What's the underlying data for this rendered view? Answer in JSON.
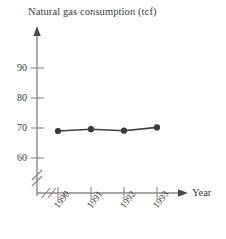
{
  "chart_data": {
    "type": "line",
    "title": "Natural gas consumption (tcf)",
    "xlabel": "Year",
    "ylabel": "",
    "categories": [
      "1990",
      "1991",
      "1992",
      "1993"
    ],
    "values": [
      69.0,
      69.6,
      69.1,
      70.2
    ],
    "series": [
      {
        "name": "Natural gas consumption",
        "values": [
          69.0,
          69.6,
          69.1,
          70.2
        ]
      }
    ],
    "ytick_labels": [
      "60",
      "70",
      "80",
      "90"
    ],
    "ytick_values": [
      60,
      70,
      80,
      90
    ],
    "xtick_labels": [
      "1990",
      "1991",
      "1992",
      "1993"
    ],
    "ylim": [
      60,
      95
    ],
    "grid": false,
    "legend": false,
    "y_axis_break": true,
    "x_axis_break": true,
    "y_axis_arrow": true,
    "x_axis_arrow": true,
    "marker": "filled-circle",
    "colors": {
      "background": "#ffffff",
      "line": "#3f3f3f",
      "marker": "#3a3a3a",
      "axis": "#8a8a8a",
      "text": "#3b3b3b"
    }
  },
  "axes": {
    "x_axis_label": "Year"
  }
}
